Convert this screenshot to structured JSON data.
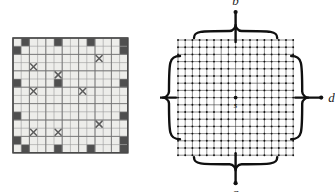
{
  "figure": {
    "panels": [
      {
        "id": "left",
        "kind": "grid-with-markers",
        "description": "Shaded square grid with dark filled cells and X-marked cells"
      },
      {
        "id": "right",
        "kind": "lattice-network",
        "description": "Square lattice network with four terminals joined by brace connectors"
      }
    ]
  },
  "colors": {
    "grid_fill": "#ededea",
    "grid_line": "#9a9a9a",
    "grid_line_major": "#6f6f6f",
    "grid_border": "#4a4a4a",
    "dark_cell": "#4f4f4f",
    "x_mark": "#5c5c5c",
    "lattice_line": "#2a2a2a",
    "lattice_node": "#111111",
    "brace": "#101010",
    "label": "#1a1a1a"
  },
  "left_grid": {
    "cols": 14,
    "rows": 14,
    "cell_px": 8.2,
    "origin_x": 13,
    "origin_y": 38,
    "dark_cells": [
      [
        1,
        0
      ],
      [
        5,
        0
      ],
      [
        9,
        0
      ],
      [
        13,
        0
      ],
      [
        0,
        1
      ],
      [
        13,
        1
      ],
      [
        0,
        5
      ],
      [
        5,
        5
      ],
      [
        13,
        5
      ],
      [
        0,
        9
      ],
      [
        13,
        9
      ],
      [
        0,
        12
      ],
      [
        13,
        12
      ],
      [
        1,
        13
      ],
      [
        5,
        13
      ],
      [
        9,
        13
      ],
      [
        13,
        13
      ]
    ],
    "x_cells": [
      [
        10,
        2
      ],
      [
        2,
        3
      ],
      [
        5,
        4
      ],
      [
        2,
        6
      ],
      [
        8,
        6
      ],
      [
        10,
        10
      ],
      [
        2,
        11
      ],
      [
        5,
        11
      ]
    ]
  },
  "right_lattice": {
    "cells": 16,
    "nodes_per_side": 17,
    "step_px": 7.2,
    "origin_x": 18,
    "origin_y": 40,
    "source": {
      "label": "s",
      "col": 8,
      "row": 8
    },
    "terminals": [
      {
        "label": "b",
        "position": "top",
        "x": 87,
        "y": 14
      },
      {
        "label": "d",
        "position": "right",
        "x": 160,
        "y": 98
      },
      {
        "label": "a",
        "position": "bottom",
        "x": 87,
        "y": 181
      },
      {
        "label": "c",
        "position": "left",
        "x": 12,
        "y": 98
      }
    ]
  }
}
